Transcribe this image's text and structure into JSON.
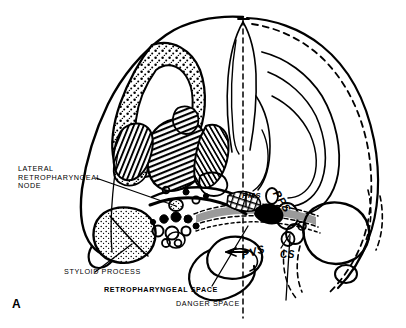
{
  "figure": {
    "panel_label": "A",
    "domain": "anatomical-cross-section-illustration",
    "background_color": "#ffffff",
    "ink_color": "#000000",
    "shaded_space_color": "#9a9a9a",
    "description_visible_text_only": true
  },
  "labels": {
    "lateral_retropharyngeal_node": {
      "lines": [
        "LATERAL",
        "RETROPHARYNGEAL",
        "NODE"
      ],
      "text": "LATERAL RETROPHARYNGEAL NODE",
      "bold": false
    },
    "styloid_process": {
      "text": "STYLOID PROCESS",
      "bold": false
    },
    "retropharyngeal_space": {
      "text": "RETROPHARYNGEAL SPACE",
      "bold": true
    },
    "danger_space": {
      "text": "DANGER SPACE",
      "bold": false
    }
  },
  "abbreviations": [
    {
      "key": "pms",
      "text": "PMS"
    },
    {
      "key": "pps",
      "text": "PPS"
    },
    {
      "key": "pvs",
      "text": "PVS"
    },
    {
      "key": "cs",
      "text": "CS"
    }
  ]
}
